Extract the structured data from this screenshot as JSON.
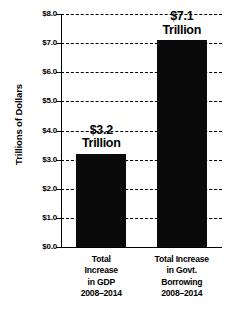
{
  "chart_data": {
    "type": "bar",
    "title": "",
    "xlabel": "",
    "ylabel": "Trillions of Dollars",
    "categories": [
      "Total Increase in GDP 2008–2014",
      "Total Increase in Govt. Borrowing 2008–2014"
    ],
    "values": [
      3.2,
      7.1
    ],
    "ylim": [
      0.0,
      8.0
    ],
    "ytick_step": 1.0,
    "grid": true,
    "legend": false,
    "bar_color": "#0a0a0a",
    "axis_color": "#000000",
    "background": "#ffffff"
  },
  "axis": {
    "title": "Trillions of Dollars",
    "ticks": [
      {
        "value": 8.0,
        "label": "$8.0"
      },
      {
        "value": 7.0,
        "label": "$7.0"
      },
      {
        "value": 6.0,
        "label": "$6.0"
      },
      {
        "value": 5.0,
        "label": "$5.0"
      },
      {
        "value": 4.0,
        "label": "$4.0"
      },
      {
        "value": 3.0,
        "label": "$3.0"
      },
      {
        "value": 2.0,
        "label": "$2.0"
      },
      {
        "value": 1.0,
        "label": "$1.0"
      },
      {
        "value": 0.0,
        "label": "$0.0"
      }
    ]
  },
  "bars": [
    {
      "value": 3.2,
      "value_label_amount": "$3.2",
      "value_label_unit": "Trillion",
      "category_lines": [
        "Total",
        "Increase",
        "in GDP",
        "2008–2014"
      ]
    },
    {
      "value": 7.1,
      "value_label_amount": "$7.1",
      "value_label_unit": "Trillion",
      "category_lines": [
        "Total Increase",
        "in Govt.",
        "Borrowing",
        "2008–2014"
      ]
    }
  ]
}
